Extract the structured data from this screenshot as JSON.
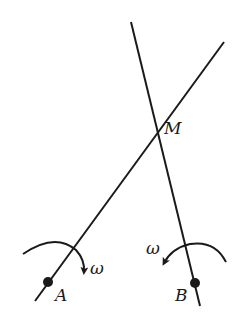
{
  "diagram": {
    "lines": [
      {
        "name": "rod-A",
        "x1": 35,
        "y1": 301,
        "x2": 224,
        "y2": 42
      },
      {
        "name": "rod-B",
        "x1": 131,
        "y1": 22,
        "x2": 200,
        "y2": 306
      }
    ],
    "points": {
      "A": {
        "label": "A",
        "x": 48,
        "y": 282
      },
      "B": {
        "label": "B",
        "x": 195,
        "y": 283
      },
      "M": {
        "label": "M",
        "x": 158,
        "y": 133
      }
    },
    "rotation_labels": {
      "A": "ω",
      "B": "ω"
    },
    "stroke_color": "#1a1a1a"
  }
}
